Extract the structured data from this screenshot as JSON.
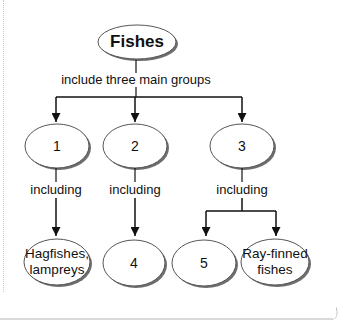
{
  "diagram": {
    "root": {
      "label": "Fishes"
    },
    "root_relation": "include three main groups",
    "groups": [
      {
        "label": "1",
        "relation": "including",
        "children": [
          {
            "label": "Hagfishes,\nlampreys"
          }
        ]
      },
      {
        "label": "2",
        "relation": "including",
        "children": [
          {
            "label": "4"
          }
        ]
      },
      {
        "label": "3",
        "relation": "including",
        "children": [
          {
            "label": "5"
          },
          {
            "label": "Ray-finned\nfishes"
          }
        ]
      }
    ]
  },
  "labels": {
    "root": "Fishes",
    "root_relation": "include three main groups",
    "group_1": "1",
    "group_2": "2",
    "group_3": "3",
    "relation_1": "including",
    "relation_2": "including",
    "relation_3": "including",
    "leaf_hagfishes_line1": "Hagfishes,",
    "leaf_hagfishes_line2": "lampreys",
    "leaf_4": "4",
    "leaf_5": "5",
    "leaf_rayfinned_line1": "Ray-finned",
    "leaf_rayfinned_line2": "fishes"
  },
  "colors": {
    "stroke": "#1a1a1a",
    "ellipse_fill": "#ffffff",
    "ellipse_shadow": "#6e6e6e",
    "text": "#111111"
  }
}
